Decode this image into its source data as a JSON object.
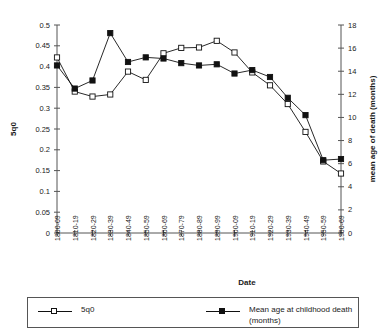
{
  "chart_data": {
    "type": "line",
    "title": "",
    "xlabel": "Date",
    "ylabel": "5q0",
    "y2label": "mean age of death (months)",
    "categories": [
      "1800-09",
      "1810-19",
      "1820-29",
      "1830-39",
      "1840-49",
      "1850-59",
      "1860-69",
      "1870-79",
      "1880-89",
      "1890-99",
      "1900-09",
      "1910-19",
      "1920-29",
      "1930-39",
      "1940-49",
      "1950-59",
      "1960-69"
    ],
    "ylim": [
      0,
      0.5
    ],
    "yticks": [
      "0",
      "0.05",
      "0.1",
      "0.15",
      "0.2",
      "0.25",
      "0.3",
      "0.35",
      "0.4",
      "0.45",
      "0.5"
    ],
    "y2lim": [
      0,
      18
    ],
    "y2ticks": [
      "0",
      "2",
      "4",
      "6",
      "8",
      "10",
      "12",
      "14",
      "16",
      "18"
    ],
    "grid": false,
    "legend_position": "bottom",
    "series": [
      {
        "name": "5q0",
        "axis": "left",
        "marker": "open-square",
        "values": [
          0.422,
          0.34,
          0.328,
          0.333,
          0.388,
          0.368,
          0.432,
          0.445,
          0.446,
          0.462,
          0.434,
          0.386,
          0.355,
          0.31,
          0.243,
          0.172,
          0.143
        ]
      },
      {
        "name": "Mean age at childhood death (months)",
        "axis": "right",
        "marker": "filled-square",
        "values": [
          14.5,
          12.5,
          13.2,
          17.3,
          14.8,
          15.2,
          15.1,
          14.7,
          14.5,
          14.6,
          13.8,
          14.1,
          13.5,
          11.7,
          10.2,
          6.3,
          6.4
        ]
      }
    ],
    "legend": [
      {
        "label": "5q0",
        "marker": "open-square"
      },
      {
        "label": "Mean age at childhood death (months)",
        "marker": "filled-square"
      }
    ]
  }
}
